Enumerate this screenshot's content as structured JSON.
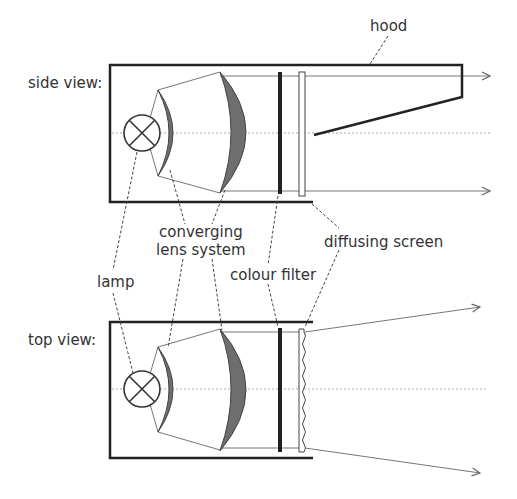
{
  "diagram": {
    "views": [
      {
        "id": "side",
        "label": "side view:"
      },
      {
        "id": "top",
        "label": "top view:"
      }
    ],
    "labels": {
      "hood": "hood",
      "converging_lens_line1": "converging",
      "converging_lens_line2": "lens system",
      "lamp": "lamp",
      "colour_filter": "colour filter",
      "diffusing_screen": "diffusing screen"
    },
    "colors": {
      "outline": "#222222",
      "lens_fill": "#6e6e6e",
      "ray": "#777777",
      "axis": "#aaaaaa",
      "leader": "#444444",
      "text": "#333333"
    }
  }
}
